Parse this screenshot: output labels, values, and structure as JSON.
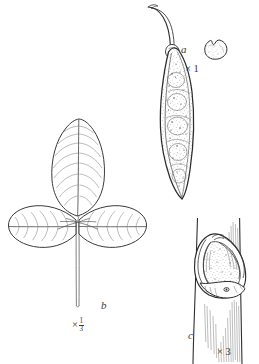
{
  "plate": {
    "kind": "botanical-line-illustration",
    "background_color": "#ffffff",
    "ink_color": "#2b2b2b",
    "stipple_color": "#6e6e6e",
    "figures": [
      {
        "key": "a",
        "label": "a",
        "scale_text": "× 1",
        "scale_prefix": "×",
        "scale_value": "1",
        "subject": "seed pod and seed",
        "parts": [
          "legume-pod",
          "pedicel",
          "seed"
        ]
      },
      {
        "key": "b",
        "label": "b",
        "scale_text": "× 1/3",
        "scale_prefix": "×",
        "scale_numerator": "1",
        "scale_denominator": "3",
        "subject": "trifoliate leaf",
        "parts": [
          "terminal-leaflet",
          "left-leaflet",
          "right-leaflet",
          "petiole"
        ]
      },
      {
        "key": "c",
        "label": "c",
        "scale_text": "× 3",
        "scale_prefix": "×",
        "scale_value": "3",
        "subject": "axillary bud on stem",
        "parts": [
          "stem",
          "bud",
          "bract"
        ]
      }
    ]
  }
}
